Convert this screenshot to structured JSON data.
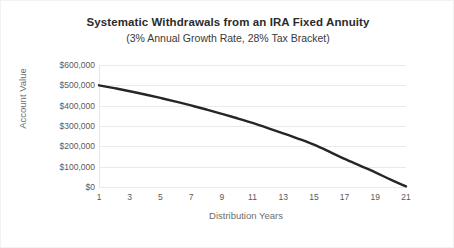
{
  "chart_data": {
    "type": "line",
    "title": "Systematic Withdrawals from an IRA Fixed Annuity",
    "subtitle": "(3% Annual Growth Rate, 28% Tax Bracket)",
    "xlabel": "Distribution Years",
    "ylabel": "Account Value",
    "xlim": [
      1,
      21
    ],
    "ylim": [
      0,
      600000
    ],
    "grid": true,
    "legend": "none",
    "line_color": "#262626",
    "gridline_color": "#eaeaea",
    "x_tick_labels": [
      "1",
      "3",
      "5",
      "7",
      "9",
      "11",
      "13",
      "15",
      "17",
      "19",
      "21"
    ],
    "x_tick_values": [
      1,
      3,
      5,
      7,
      9,
      11,
      13,
      15,
      17,
      19,
      21
    ],
    "y_tick_labels": [
      "$600,000",
      "$500,000",
      "$400,000",
      "$300,000",
      "$200,000",
      "$100,000",
      "$0"
    ],
    "y_tick_values": [
      600000,
      500000,
      400000,
      300000,
      200000,
      100000,
      0
    ],
    "series": [
      {
        "name": "Account Value",
        "x": [
          1,
          2,
          3,
          4,
          5,
          6,
          7,
          8,
          9,
          10,
          11,
          12,
          13,
          14,
          15,
          16,
          17,
          18,
          19,
          20,
          21
        ],
        "values": [
          500000,
          486000,
          471000,
          455000,
          438000,
          420000,
          401000,
          381000,
          360000,
          338000,
          315000,
          290000,
          264000,
          237000,
          208000,
          174000,
          138000,
          105000,
          72000,
          36000,
          3000
        ]
      }
    ]
  }
}
